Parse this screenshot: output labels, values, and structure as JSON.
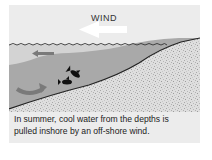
{
  "diagram": {
    "wind_label": "WIND",
    "caption": {
      "line1": "In summer, cool water from the depths is",
      "line2": "pulled inshore by an off-shore wind."
    },
    "elements": {
      "wind_arrow": {
        "direction": "left",
        "color": "#ffffff"
      },
      "surface_current_arrow": {
        "direction": "left",
        "color": "#7a7a7a"
      },
      "upwelling_arrow": {
        "shape": "curved",
        "color": "#7a7a7a"
      },
      "fish_count": 2
    },
    "colors": {
      "panel_bg": "#ececec",
      "water": "#d3d3d3",
      "cool_water": "#a9a9a9",
      "seabed": "#dcdcdc",
      "shore_line": "#222222"
    }
  }
}
